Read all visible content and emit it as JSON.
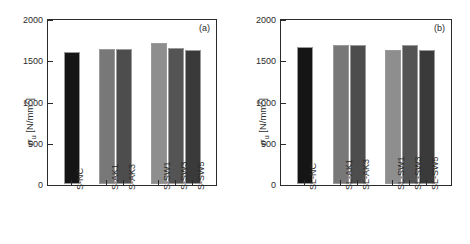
{
  "figure": {
    "background": "#ffffff",
    "axis_color": "#2b2b2b"
  },
  "chart_data": [
    {
      "type": "bar",
      "panel_label": "(a)",
      "title": "",
      "xlabel": "",
      "ylabel": "σ_u [N/mm²]",
      "ylim": [
        0,
        2000
      ],
      "yticks": [
        0,
        500,
        1000,
        1500,
        2000
      ],
      "ytick_labels": [
        "0",
        "500",
        "1000",
        "1500",
        "2000"
      ],
      "grid": false,
      "legend": "none",
      "categories": [
        "S-NC",
        "S-AK1",
        "S-AK3",
        "S-SW1",
        "S-SW3",
        "S-SW5"
      ],
      "values": [
        1600,
        1641,
        1641,
        1712,
        1653,
        1629
      ],
      "colors": [
        "#151515",
        "#787878",
        "#4d4d4d",
        "#8e8e8e",
        "#545454",
        "#3a3a3a"
      ]
    },
    {
      "type": "bar",
      "panel_label": "(b)",
      "title": "",
      "xlabel": "",
      "ylabel": "σ_u [N/mm²]",
      "ylim": [
        0,
        2000
      ],
      "yticks": [
        0,
        500,
        1000,
        1500,
        2000
      ],
      "ytick_labels": [
        "0",
        "500",
        "1000",
        "1500",
        "2000"
      ],
      "grid": false,
      "legend": "none",
      "categories": [
        "SL-NC",
        "SL-AK1",
        "SL-AK3",
        "SL-SW1",
        "SL-SW3",
        "SL-SW5"
      ],
      "values": [
        1665,
        1689,
        1689,
        1629,
        1689,
        1629
      ],
      "colors": [
        "#151515",
        "#787878",
        "#4d4d4d",
        "#8e8e8e",
        "#545454",
        "#3a3a3a"
      ]
    }
  ],
  "axis_title_parts": {
    "symbol": "σ",
    "subscript": "u",
    "unit_open": " [N/mm",
    "unit_exp": "2",
    "unit_close": "]"
  }
}
